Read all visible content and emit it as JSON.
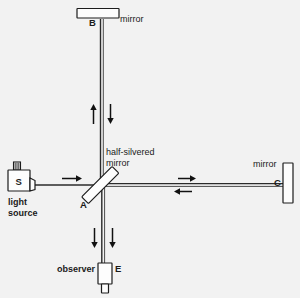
{
  "figure": {
    "background_color": "#f2f2f2",
    "ink_color": "#1a1a1a",
    "width": 300,
    "height": 298
  },
  "labels": {
    "point_b": "B",
    "point_a": "A",
    "point_c": "C",
    "point_e": "E",
    "point_s": "S",
    "mirror_top": "mirror",
    "mirror_right": "mirror",
    "beam_splitter_line1": "half-silvered",
    "beam_splitter_line2": "mirror",
    "light_source_line1": "light",
    "light_source_line2": "source",
    "observer": "observer"
  },
  "components": [
    {
      "name": "light-source",
      "label": "S",
      "caption": "light source",
      "shape": "box-with-filament"
    },
    {
      "name": "beam-splitter",
      "label": "A",
      "caption": "half-silvered mirror",
      "shape": "tilted-plate-45deg"
    },
    {
      "name": "mirror-top",
      "label": "B",
      "caption": "mirror",
      "shape": "horizontal-bar"
    },
    {
      "name": "mirror-right",
      "label": "C",
      "caption": "mirror",
      "shape": "vertical-bar"
    },
    {
      "name": "observer-detector",
      "label": "E",
      "caption": "observer",
      "shape": "eyepiece"
    }
  ],
  "beams": [
    {
      "name": "source-to-splitter",
      "direction": "right",
      "arrows": 1
    },
    {
      "name": "splitter-to-top-mirror",
      "direction": "up",
      "arrows": 1
    },
    {
      "name": "top-mirror-to-splitter",
      "direction": "down",
      "arrows": 1
    },
    {
      "name": "splitter-to-right-mirror",
      "direction": "right",
      "arrows": 1
    },
    {
      "name": "right-mirror-to-splitter",
      "direction": "left",
      "arrows": 1
    },
    {
      "name": "splitter-to-observer-a",
      "direction": "down",
      "arrows": 1
    },
    {
      "name": "splitter-to-observer-b",
      "direction": "down",
      "arrows": 1
    }
  ]
}
